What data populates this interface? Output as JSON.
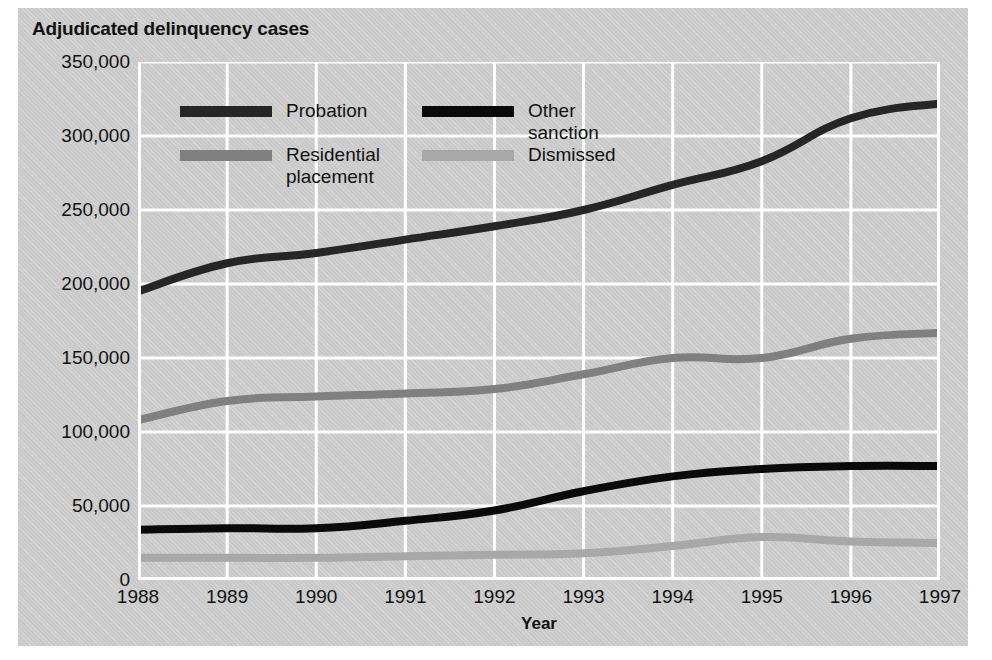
{
  "chart_data": {
    "type": "line",
    "title": "Adjudicated delinquency cases",
    "xlabel": "Year",
    "ylabel": "",
    "grid": true,
    "legend_position": "inside-top-left",
    "x": [
      1988,
      1989,
      1990,
      1991,
      1992,
      1993,
      1994,
      1995,
      1996,
      1997
    ],
    "categories": [
      "1988",
      "1989",
      "1990",
      "1991",
      "1992",
      "1993",
      "1994",
      "1995",
      "1996",
      "1997"
    ],
    "xlim": [
      1988,
      1997
    ],
    "ylim": [
      0,
      350000
    ],
    "ytick_values": [
      0,
      50000,
      100000,
      150000,
      200000,
      250000,
      300000,
      350000
    ],
    "ytick_labels": [
      "0",
      "50,000",
      "100,000",
      "150,000",
      "200,000",
      "250,000",
      "300,000",
      "350,000"
    ],
    "series": [
      {
        "name": "Probation",
        "color": "#262626",
        "values": [
          195000,
          214000,
          221000,
          230000,
          239000,
          250000,
          267000,
          283000,
          312000,
          322000
        ]
      },
      {
        "name": "Other sanction",
        "color": "#0a0a0a",
        "values": [
          34000,
          35000,
          35000,
          40000,
          47000,
          60000,
          70000,
          75000,
          77000,
          77000
        ]
      },
      {
        "name": "Residential\nplacement",
        "color": "#808080",
        "values": [
          108000,
          121000,
          124000,
          126000,
          129000,
          139000,
          150000,
          150000,
          163000,
          167000
        ]
      },
      {
        "name": "Dismissed",
        "color": "#a8a8a8",
        "values": [
          15000,
          15000,
          15000,
          16000,
          17000,
          18000,
          23000,
          29000,
          26000,
          25000
        ]
      }
    ]
  },
  "legend": {
    "entries": [
      {
        "label": "Probation",
        "color": "#262626"
      },
      {
        "label": "Other sanction",
        "color": "#0a0a0a"
      },
      {
        "label": "Residential\nplacement",
        "color": "#808080"
      },
      {
        "label": "Dismissed",
        "color": "#a8a8a8"
      }
    ]
  },
  "colors": {
    "panel_background": "#c9c9c9",
    "page_background": "#ffffff",
    "gridline": "#ffffff",
    "text": "#111111"
  }
}
